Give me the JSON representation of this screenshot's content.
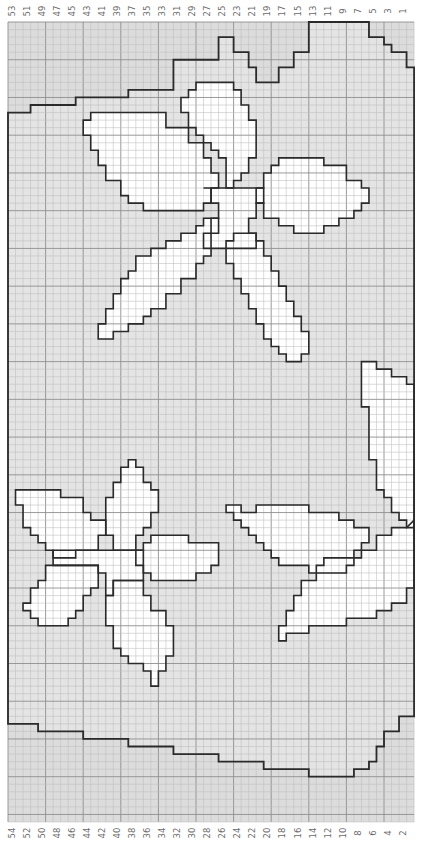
{
  "chart": {
    "title": "",
    "columns": 54,
    "rows": 106,
    "grid": {
      "x0": 8,
      "y0": 22,
      "cell_w": 7.52,
      "cell_h": 7.547
    },
    "colors": {
      "background_gray": "#dcdcdc",
      "inner_gray": "#e4e4e4",
      "motif_white": "#ffffff",
      "grid_minor": "#bdbdbd",
      "grid_major": "#8f8f8f",
      "outline": "#2a2a2a",
      "label": "#6a6a6a"
    },
    "top_labels": [
      "53",
      "51",
      "49",
      "47",
      "45",
      "43",
      "41",
      "39",
      "37",
      "35",
      "33",
      "31",
      "29",
      "27",
      "25",
      "23",
      "21",
      "19",
      "17",
      "15",
      "13",
      "11",
      "9",
      "7",
      "5",
      "3",
      "1"
    ],
    "bottom_labels": [
      "54",
      "52",
      "50",
      "48",
      "46",
      "44",
      "42",
      "40",
      "38",
      "36",
      "34",
      "32",
      "30",
      "28",
      "26",
      "24",
      "22",
      "20",
      "18",
      "16",
      "14",
      "12",
      "10",
      "8",
      "6",
      "4",
      "2"
    ]
  },
  "chart_data": {
    "type": "heatmap",
    "xlabel": "Column number",
    "ylabel": "",
    "x_ticks_top": [
      53,
      51,
      49,
      47,
      45,
      43,
      41,
      39,
      37,
      35,
      33,
      31,
      29,
      27,
      25,
      23,
      21,
      19,
      17,
      15,
      13,
      11,
      9,
      7,
      5,
      3,
      1
    ],
    "x_ticks_bottom": [
      54,
      52,
      50,
      48,
      46,
      44,
      42,
      40,
      38,
      36,
      34,
      32,
      30,
      28,
      26,
      24,
      22,
      20,
      18,
      16,
      14,
      12,
      10,
      8,
      6,
      4,
      2
    ],
    "columns": 54,
    "rows": 106,
    "legend": [
      {
        "name": "background (outer)",
        "color": "#dcdcdc"
      },
      {
        "name": "panel",
        "color": "#e4e4e4"
      },
      {
        "name": "motif (flowers/leaves)",
        "color": "#ffffff"
      }
    ],
    "motifs": [
      "upper-right five-petal flower",
      "lower-left five-petal flower",
      "lower-right leaf spray"
    ],
    "grid": true,
    "major_grid_every": 5
  }
}
